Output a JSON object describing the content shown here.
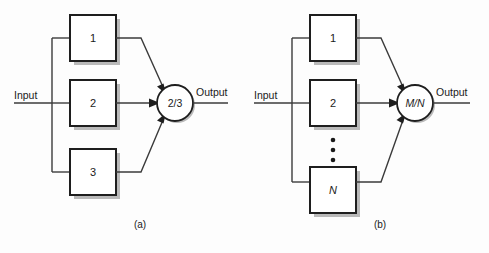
{
  "figure": {
    "background_color": "#fdfdfd",
    "line_color": "#3b3b3b",
    "outline_color": "#1e1e1e",
    "shadow_color": "#b9b9b9"
  },
  "panels": [
    {
      "caption": "(a)",
      "input_label": "Input",
      "output_label": "Output",
      "voter": {
        "label": "2/3",
        "italic": false
      },
      "modules": [
        {
          "label": "1",
          "italic": false
        },
        {
          "label": "2",
          "italic": false
        },
        {
          "label": "3",
          "italic": false
        }
      ],
      "has_ellipsis": false
    },
    {
      "caption": "(b)",
      "input_label": "Input",
      "output_label": "Output",
      "voter": {
        "label": "M/N",
        "italic": true
      },
      "modules": [
        {
          "label": "1",
          "italic": false
        },
        {
          "label": "2",
          "italic": false
        },
        {
          "label": "N",
          "italic": true
        }
      ],
      "has_ellipsis": true,
      "ellipsis_dots": 3
    }
  ]
}
